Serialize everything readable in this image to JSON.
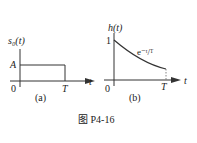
{
  "figure": {
    "caption": "图 P4-16",
    "panel_a": {
      "sublabel": "(a)",
      "y_axis_label": "s₀(t)",
      "x_axis_label": "t",
      "origin_label": "0",
      "level_label": "A",
      "t_label": "T"
    },
    "panel_b": {
      "sublabel": "(b)",
      "y_axis_label": "h(t)",
      "x_axis_label": "t",
      "origin_label": "0",
      "level_label": "1",
      "t_label": "T",
      "curve_label": "e⁻ᵗ/ᵀ"
    }
  }
}
